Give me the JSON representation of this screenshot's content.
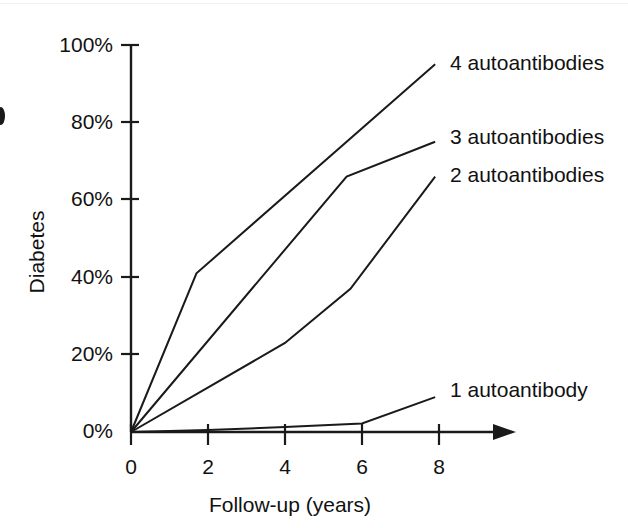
{
  "chart_data": {
    "type": "line",
    "title": "",
    "xlabel": "Follow-up (years)",
    "ylabel": "Diabetes",
    "xlim": [
      0,
      9.6
    ],
    "ylim": [
      0,
      100
    ],
    "grid": false,
    "legend_position": "right-inline-labels",
    "x_ticks": [
      "0",
      "2",
      "4",
      "6",
      "8"
    ],
    "x_tick_values": [
      0,
      2,
      4,
      6,
      8
    ],
    "y_ticks": [
      "0%",
      "20%",
      "40%",
      "60%",
      "80%",
      "100%"
    ],
    "y_tick_values": [
      0,
      20,
      40,
      60,
      80,
      100
    ],
    "series": [
      {
        "name": "4 autoantibodies",
        "label": "4 autoantibodies",
        "x": [
          0,
          1.7,
          7.9
        ],
        "values": [
          0,
          41,
          95
        ]
      },
      {
        "name": "3 autoantibodies",
        "label": "3 autoantibodies",
        "x": [
          0,
          5.6,
          7.9
        ],
        "values": [
          0,
          66,
          75
        ]
      },
      {
        "name": "2 autoantibodies",
        "label": "2 autoantibodies",
        "x": [
          0,
          4.0,
          5.7,
          7.9
        ],
        "values": [
          0,
          23,
          37,
          66
        ]
      },
      {
        "name": "1 autoantibody",
        "label": "1 autoantibody",
        "x": [
          0,
          2.0,
          4.0,
          6.0,
          7.9
        ],
        "values": [
          0,
          0.5,
          1.3,
          2.2,
          9
        ]
      }
    ]
  },
  "labels": {
    "y_axis_title": "Diabetes",
    "x_axis_title": "Follow-up (years)",
    "series_4": "4 autoantibodies",
    "series_3": "3 autoantibodies",
    "series_2": "2 autoantibodies",
    "series_1": "1 autoantibody",
    "y_tick_100": "100%",
    "y_tick_80": "80%",
    "y_tick_60": "60%",
    "y_tick_40": "40%",
    "y_tick_20": "20%",
    "y_tick_0": "0%",
    "x_tick_0": "0",
    "x_tick_2": "2",
    "x_tick_4": "4",
    "x_tick_6": "6",
    "x_tick_8": "8"
  },
  "colors": {
    "line": "#1a1a1a",
    "axis": "#1a1a1a",
    "background": "#ffffff",
    "top_rule": "#f0f0f2"
  }
}
